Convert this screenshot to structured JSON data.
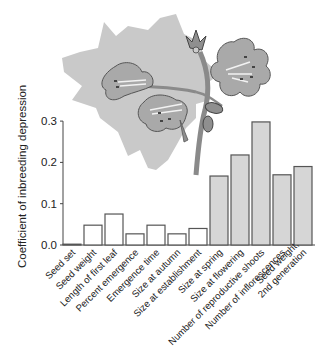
{
  "chart_data": {
    "type": "bar",
    "title": "",
    "xlabel": "",
    "ylabel": "Coefficient of inbreeding depression",
    "ylim": [
      0,
      0.3
    ],
    "yticks": [
      "0.0",
      "0.1",
      "0.2",
      "0.3"
    ],
    "grid": false,
    "legend": null,
    "categories": [
      "Seed set",
      "Seed weight",
      "Length of first leaf",
      "Percent emergence",
      "Emergence time",
      "Size at autumn",
      "Size at establishment",
      "Size at spring",
      "Size at flowering",
      "Number of reproductive shoots",
      "Number of inflorescences",
      "Seed weight, 2nd generation"
    ],
    "values": [
      0.002,
      0.048,
      0.075,
      0.027,
      0.048,
      0.027,
      0.04,
      0.167,
      0.218,
      0.298,
      0.17,
      0.19
    ],
    "bar_fill": [
      "white",
      "white",
      "white",
      "white",
      "white",
      "white",
      "white",
      "grey",
      "grey",
      "grey",
      "grey",
      "grey"
    ],
    "annotations": [
      "Illustration of a flowering plant stem with leaf silhouette behind the chart"
    ]
  },
  "colors": {
    "white_bar": "#ffffff",
    "grey_bar": "#d6d6d6",
    "bar_outline": "#555555",
    "leaf": "#c9c9c9",
    "flower": "#a9a9a9"
  },
  "labels": {
    "ylabel": "Coefficient of inbreeding depression",
    "yticks": [
      "0.0",
      "0.1",
      "0.2",
      "0.3"
    ],
    "xticks": [
      [
        "Seed set"
      ],
      [
        "Seed weight"
      ],
      [
        "Length of first leaf"
      ],
      [
        "Percent emergence"
      ],
      [
        "Emergence time"
      ],
      [
        "Size at autumn"
      ],
      [
        "Size at establishment"
      ],
      [
        "Size at spring"
      ],
      [
        "Size at flowering"
      ],
      [
        "Number of reproductive shoots"
      ],
      [
        "Number of inflorescences"
      ],
      [
        "Seed weight,",
        "2nd generation"
      ]
    ]
  }
}
